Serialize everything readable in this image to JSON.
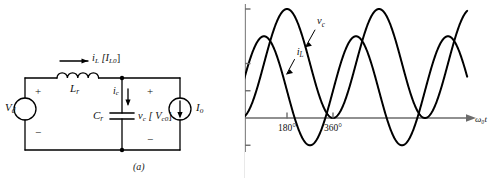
{
  "figure": {
    "caption_a": "(a)",
    "caption_b": "(b)"
  },
  "circuit": {
    "source_voltage_label": "V",
    "source_voltage_sub": "d",
    "source_plus": "+",
    "source_minus": "−",
    "inductor_label": "L",
    "inductor_sub": "r",
    "inductor_current_label": "i",
    "inductor_current_sub": "L",
    "inductor_current_initial": "[I",
    "inductor_current_initial_sub": "L0",
    "inductor_current_initial_close": "]",
    "cap_current_label": "i",
    "cap_current_sub": "c",
    "capacitor_label": "C",
    "capacitor_sub": "r",
    "cap_voltage_label": "v",
    "cap_voltage_sub": "c",
    "cap_voltage_initial": "[ V",
    "cap_voltage_initial_sub": "c0",
    "cap_voltage_initial_close": "]",
    "cap_plus": "+",
    "cap_minus": "−",
    "current_source_label": "I",
    "current_source_sub": "o"
  },
  "chart_data": {
    "type": "line",
    "title": "",
    "xlabel": "ω₀t",
    "ylabel": "",
    "xlim": [
      -20,
      900
    ],
    "ylim": [
      -0.75,
      2.15
    ],
    "grid": false,
    "legend": "inline-annotations",
    "yticks": [
      2.0,
      1.0,
      0.5,
      0,
      -0.5
    ],
    "ytick_labels": [
      "2.0",
      "1.0",
      "0.5",
      "0",
      "−0.5"
    ],
    "xticks": [
      180,
      360
    ],
    "xtick_labels": [
      "180°",
      "360°"
    ],
    "series": [
      {
        "name": "v_c",
        "label": "v",
        "label_sub": "c",
        "formula": "1.0 - 1.0*cos(wt)",
        "amplitude": 1.0,
        "offset": 1.0,
        "phase_deg": 180,
        "period_deg": 360,
        "x": [
          0,
          30,
          60,
          90,
          120,
          150,
          180,
          210,
          240,
          270,
          300,
          330,
          360,
          390,
          420,
          450,
          480,
          510,
          540,
          570,
          600,
          630,
          660,
          690,
          720,
          750,
          780,
          810,
          840,
          870,
          900
        ],
        "y": [
          0.0,
          0.134,
          0.5,
          1.0,
          1.5,
          1.866,
          2.0,
          1.866,
          1.5,
          1.0,
          0.5,
          0.134,
          0.0,
          0.134,
          0.5,
          1.0,
          1.5,
          1.866,
          2.0,
          1.866,
          1.5,
          1.0,
          0.5,
          0.134,
          0.0,
          0.134,
          0.5,
          1.0,
          1.5,
          1.866,
          2.0
        ]
      },
      {
        "name": "i_L",
        "label": "i",
        "label_sub": "L",
        "formula": "0.5 + 1.0*sin(wt)",
        "amplitude": 1.0,
        "offset": 0.5,
        "phase_deg": 0,
        "period_deg": 360,
        "x": [
          0,
          30,
          60,
          90,
          120,
          150,
          180,
          210,
          240,
          270,
          300,
          330,
          360,
          390,
          420,
          450,
          480,
          510,
          540,
          570,
          600,
          630,
          660,
          690,
          720,
          750,
          780,
          810,
          840,
          870,
          900
        ],
        "y": [
          0.5,
          1.0,
          1.366,
          1.5,
          1.366,
          1.0,
          0.5,
          0.0,
          -0.366,
          -0.5,
          -0.366,
          0.0,
          0.5,
          1.0,
          1.366,
          1.5,
          1.366,
          1.0,
          0.5,
          0.0,
          -0.366,
          -0.5,
          -0.366,
          0.0,
          0.5,
          1.0,
          1.366,
          1.5,
          1.366,
          1.0,
          0.5
        ]
      }
    ],
    "annotations": [
      {
        "name": "vc-annotation",
        "text": "v",
        "sub": "c",
        "x_deg": 290,
        "y_val": 1.72
      },
      {
        "name": "iL-annotation",
        "text": "i",
        "sub": "L",
        "x_deg": 210,
        "y_val": 1.16
      }
    ]
  }
}
